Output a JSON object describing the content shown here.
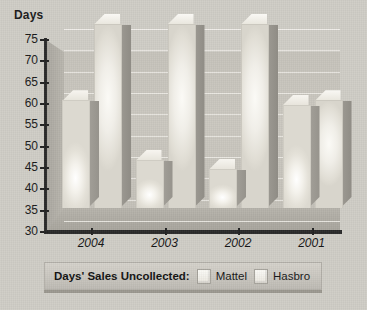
{
  "chart_data": {
    "type": "bar",
    "title": "",
    "ylabel": "Days",
    "xlabel": "",
    "categories": [
      "2004",
      "2003",
      "2002",
      "2001"
    ],
    "series": [
      {
        "name": "Mattel",
        "values": [
          55,
          41,
          39,
          54
        ]
      },
      {
        "name": "Hasbro",
        "values": [
          73,
          73,
          73,
          55
        ]
      }
    ],
    "ylim": [
      30,
      75
    ],
    "yticks": [
      30,
      35,
      40,
      45,
      50,
      55,
      60,
      65,
      70,
      75
    ],
    "ytick_labels": [
      "30",
      "35",
      "40",
      "45",
      "50",
      "55",
      "60",
      "65",
      "70",
      "75"
    ],
    "grid": true,
    "legend_position": "bottom",
    "style": "3d-bar"
  },
  "axis": {
    "y_title": "Days",
    "y_tick_labels": [
      "75",
      "70",
      "65",
      "60",
      "55",
      "50",
      "45",
      "40",
      "35",
      "30"
    ],
    "x_tick_labels": [
      "2004",
      "2003",
      "2002",
      "2001"
    ]
  },
  "legend": {
    "title": "Days' Sales Uncollected:",
    "items": [
      {
        "label": "Mattel",
        "color": "#f2efe9"
      },
      {
        "label": "Hasbro",
        "color": "#f2efe9"
      }
    ]
  },
  "colors": {
    "background": "#cfcdc6",
    "plot_wall": "#c6c3bb",
    "axis": "#2a2a2a",
    "gridline": "#eceae4",
    "bar_face": "#f1eee8",
    "bar_side": "#9a978f",
    "legend_bar": "#c9c6bf",
    "text": "#141414"
  }
}
